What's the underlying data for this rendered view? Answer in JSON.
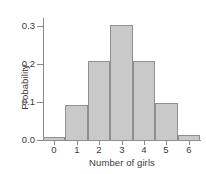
{
  "chart_data": {
    "type": "bar",
    "title": "",
    "subtitle": "",
    "xlabel": "Number of girls",
    "ylabel": "Probability",
    "categories": [
      "0",
      "1",
      "2",
      "3",
      "4",
      "5",
      "6"
    ],
    "values": [
      0.01,
      0.095,
      0.21,
      0.305,
      0.21,
      0.1,
      0.015
    ],
    "series": [
      {
        "name": "Probability",
        "values": [
          0.01,
          0.095,
          0.21,
          0.305,
          0.21,
          0.1,
          0.015
        ]
      }
    ],
    "xlim": [
      -0.5,
      6.5
    ],
    "ylim": [
      0.0,
      0.32
    ],
    "ytick_labels": [
      "0.0",
      "0.1",
      "0.2",
      "0.3"
    ],
    "ytick_values": [
      0.0,
      0.1,
      0.2,
      0.3
    ],
    "xtick_labels": [
      "0",
      "1",
      "2",
      "3",
      "4",
      "5",
      "6"
    ],
    "grid": false,
    "legend": false,
    "legend_position": "none",
    "bar_fill_color": "#c9c9c9",
    "bar_edge_color": "#8f8f8f",
    "axis_color": "#8a8a8a",
    "text_color": "#3a3a3a",
    "background_color": "#ffffff",
    "annotations": []
  }
}
